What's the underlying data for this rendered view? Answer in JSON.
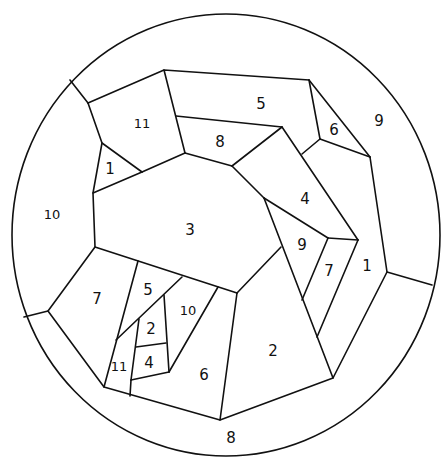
{
  "diagram": {
    "type": "numbered region map (circle subdivided into polygonal regions)",
    "stroke_color": "#111111",
    "background_color": "#ffffff",
    "labels": [
      {
        "id": "r5-top",
        "text": "5",
        "x": 261,
        "y": 104
      },
      {
        "id": "r9-right",
        "text": "9",
        "x": 379,
        "y": 121
      },
      {
        "id": "r6-top",
        "text": "6",
        "x": 334,
        "y": 130
      },
      {
        "id": "r11-top",
        "text": "11",
        "x": 142,
        "y": 123
      },
      {
        "id": "r8-top",
        "text": "8",
        "x": 220,
        "y": 142
      },
      {
        "id": "r1-left",
        "text": "1",
        "x": 110,
        "y": 169
      },
      {
        "id": "r4-mid",
        "text": "4",
        "x": 305,
        "y": 199
      },
      {
        "id": "r10-left",
        "text": "10",
        "x": 52,
        "y": 214
      },
      {
        "id": "r3-center",
        "text": "3",
        "x": 190,
        "y": 230
      },
      {
        "id": "r9-mid",
        "text": "9",
        "x": 302,
        "y": 245
      },
      {
        "id": "r7-mid",
        "text": "7",
        "x": 329,
        "y": 271
      },
      {
        "id": "r1-right",
        "text": "1",
        "x": 367,
        "y": 266
      },
      {
        "id": "r7-left",
        "text": "7",
        "x": 97,
        "y": 299
      },
      {
        "id": "r5-lower",
        "text": "5",
        "x": 148,
        "y": 290
      },
      {
        "id": "r10-lower",
        "text": "10",
        "x": 188,
        "y": 310
      },
      {
        "id": "r2-small",
        "text": "2",
        "x": 151,
        "y": 329
      },
      {
        "id": "r2-large",
        "text": "2",
        "x": 273,
        "y": 351
      },
      {
        "id": "r11-lower",
        "text": "11",
        "x": 119,
        "y": 366
      },
      {
        "id": "r4-small",
        "text": "4",
        "x": 149,
        "y": 363
      },
      {
        "id": "r6-lower",
        "text": "6",
        "x": 204,
        "y": 375
      },
      {
        "id": "r8-bottom",
        "text": "8",
        "x": 231,
        "y": 438
      }
    ]
  }
}
